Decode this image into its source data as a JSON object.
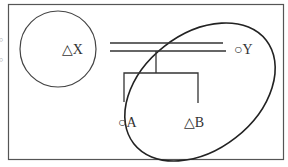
{
  "diagram": {
    "type": "set-relation-diagram",
    "nodes": {
      "x": {
        "symbol": "△",
        "letter": "X",
        "label": "△X"
      },
      "y": {
        "symbol": "○",
        "letter": "Y",
        "label": "○Y"
      },
      "a": {
        "symbol": "○",
        "letter": "A",
        "label": "○A"
      },
      "b": {
        "symbol": "△",
        "letter": "B",
        "label": "△B"
      }
    },
    "regions": [
      {
        "name": "circle",
        "contains": [
          "X"
        ]
      },
      {
        "name": "ellipse",
        "contains": [
          "Y",
          "A",
          "B"
        ]
      }
    ],
    "connections": [
      {
        "type": "double-line",
        "from": "X",
        "to": "Y"
      },
      {
        "type": "branch",
        "from": "double-line",
        "to": [
          "A",
          "B"
        ]
      }
    ],
    "colors": {
      "stroke": "#333333",
      "frame": "#555555",
      "background": "#ffffff"
    }
  }
}
